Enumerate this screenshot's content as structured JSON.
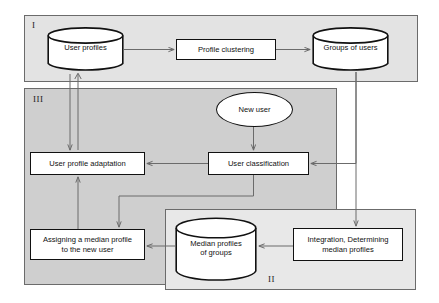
{
  "diagram": {
    "regions": [
      {
        "id": "I",
        "label": "I"
      },
      {
        "id": "II",
        "label": "II"
      },
      {
        "id": "III",
        "label": "III"
      }
    ],
    "nodes": {
      "user_profiles": {
        "label": "User profiles",
        "shape": "cylinder"
      },
      "profile_clustering": {
        "label": "Profile clustering",
        "shape": "rectangle"
      },
      "groups_of_users": {
        "label": "Groups of users",
        "shape": "cylinder"
      },
      "new_user": {
        "label": "New user",
        "shape": "ellipse"
      },
      "user_classification": {
        "label": "User classification",
        "shape": "rectangle"
      },
      "user_profile_adaptation": {
        "label": "User profile adaptation",
        "shape": "rectangle"
      },
      "assigning_median_profile": {
        "line1": "Assigning a median profile",
        "line2": "to the new user",
        "shape": "rectangle"
      },
      "median_profiles_of_groups": {
        "line1": "Median profiles",
        "line2": "of groups",
        "shape": "cylinder"
      },
      "integration_determining": {
        "line1": "Integration, Determining",
        "line2": "median profiles",
        "shape": "rectangle"
      }
    },
    "colors": {
      "region_I_fill": "#e3e3e3",
      "region_II_fill": "#e8e8e8",
      "region_III_fill": "#cfcfcf",
      "node_fill": "#ffffff",
      "node_stroke": "#111111",
      "connector_stroke": "#6b6b6b",
      "background": "#ffffff"
    },
    "edges": [
      {
        "from": "user_profiles",
        "to": "profile_clustering"
      },
      {
        "from": "profile_clustering",
        "to": "groups_of_users"
      },
      {
        "from": "groups_of_users",
        "to": "user_classification"
      },
      {
        "from": "groups_of_users",
        "to": "integration_determining"
      },
      {
        "from": "new_user",
        "to": "user_classification"
      },
      {
        "from": "user_classification",
        "to": "user_profile_adaptation"
      },
      {
        "from": "user_classification",
        "to": "assigning_median_profile"
      },
      {
        "from": "user_profile_adaptation",
        "to": "user_profiles"
      },
      {
        "from": "user_profiles",
        "to": "user_profile_adaptation"
      },
      {
        "from": "assigning_median_profile",
        "to": "user_profile_adaptation"
      },
      {
        "from": "integration_determining",
        "to": "median_profiles_of_groups"
      },
      {
        "from": "median_profiles_of_groups",
        "to": "assigning_median_profile"
      }
    ]
  }
}
